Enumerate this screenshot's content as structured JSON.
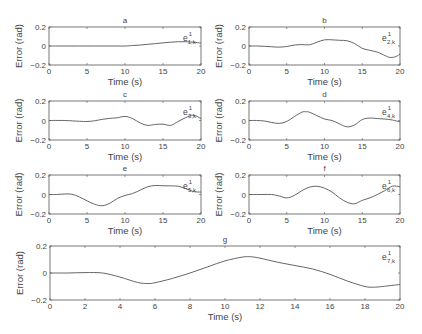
{
  "chart_data": [
    {
      "type": "line",
      "panel": "a",
      "title": "a",
      "xlabel": "Time (s)",
      "ylabel": "Error (rad)",
      "xlim": [
        0,
        20
      ],
      "ylim": [
        -0.2,
        0.2
      ],
      "xticks": [
        0,
        5,
        10,
        15,
        20
      ],
      "yticks": [
        -0.2,
        0,
        0.2
      ],
      "legend": "e^1_{1,k}",
      "x": [
        0,
        2,
        4,
        6,
        8,
        10,
        11,
        12,
        13,
        14,
        15,
        16,
        17,
        18,
        19,
        20
      ],
      "y": [
        0,
        0,
        0,
        0,
        0,
        0,
        0.005,
        0.01,
        0.018,
        0.025,
        0.033,
        0.04,
        0.045,
        0.045,
        0.04,
        0.03
      ]
    },
    {
      "type": "line",
      "panel": "b",
      "title": "b",
      "xlabel": "Time (s)",
      "ylabel": "Error (rad)",
      "xlim": [
        0,
        20
      ],
      "ylim": [
        -0.2,
        0.2
      ],
      "xticks": [
        0,
        5,
        10,
        15,
        20
      ],
      "yticks": [
        -0.2,
        0,
        0.2
      ],
      "legend": "e^1_{2,k}",
      "x": [
        0,
        1,
        2,
        3,
        4,
        5,
        6,
        7,
        8,
        9,
        10,
        11,
        12,
        13,
        14,
        15,
        16,
        17,
        18,
        18.5,
        19,
        19.5,
        20
      ],
      "y": [
        0,
        0,
        -0.003,
        -0.008,
        -0.012,
        -0.005,
        0.01,
        0.015,
        0.012,
        0.04,
        0.065,
        0.065,
        0.06,
        0.055,
        0.025,
        -0.025,
        -0.045,
        -0.065,
        -0.1,
        -0.118,
        -0.12,
        -0.11,
        -0.085
      ]
    },
    {
      "type": "line",
      "panel": "c",
      "title": "c",
      "xlabel": "Time (s)",
      "ylabel": "Error (rad)",
      "xlim": [
        0,
        20
      ],
      "ylim": [
        -0.2,
        0.2
      ],
      "xticks": [
        0,
        5,
        10,
        15,
        20
      ],
      "yticks": [
        -0.2,
        0,
        0.2
      ],
      "legend": "e^1_{3,k}",
      "x": [
        0,
        2,
        4,
        5,
        6,
        7,
        8,
        9,
        10,
        11,
        12,
        13,
        14,
        15,
        16,
        17,
        18,
        19,
        20
      ],
      "y": [
        0,
        0,
        -0.008,
        -0.01,
        -0.003,
        0.012,
        0.022,
        0.028,
        0.042,
        0.02,
        -0.025,
        -0.05,
        -0.04,
        -0.038,
        -0.05,
        -0.01,
        0.03,
        0.055,
        0.02
      ]
    },
    {
      "type": "line",
      "panel": "d",
      "title": "d",
      "xlabel": "Time (s)",
      "ylabel": "Error (rad)",
      "xlim": [
        0,
        20
      ],
      "ylim": [
        -0.2,
        0.2
      ],
      "xticks": [
        0,
        5,
        10,
        15,
        20
      ],
      "yticks": [
        -0.2,
        0,
        0.2
      ],
      "legend": "e^1_{4,k}",
      "x": [
        0,
        1,
        2,
        3,
        4,
        5,
        6,
        7,
        7.5,
        8,
        9,
        10,
        11,
        12,
        13,
        14,
        15,
        16,
        17,
        18,
        19,
        20
      ],
      "y": [
        0,
        0,
        -0.005,
        -0.02,
        -0.03,
        -0.01,
        0.04,
        0.085,
        0.09,
        0.085,
        0.05,
        0.015,
        0,
        -0.035,
        -0.065,
        -0.045,
        0.01,
        0.025,
        0.02,
        0.015,
        0.005,
        -0.015
      ]
    },
    {
      "type": "line",
      "panel": "e",
      "title": "e",
      "xlabel": "Time (s)",
      "ylabel": "Error (rad)",
      "xlim": [
        0,
        20
      ],
      "ylim": [
        -0.2,
        0.2
      ],
      "xticks": [
        0,
        5,
        10,
        15,
        20
      ],
      "yticks": [
        -0.2,
        0,
        0.2
      ],
      "legend": "e^1_{5,k}",
      "x": [
        0,
        1,
        2,
        3,
        4,
        5,
        6,
        7,
        8,
        9,
        10,
        11,
        12,
        13,
        14,
        15,
        16,
        17,
        18,
        19,
        20
      ],
      "y": [
        0,
        0,
        0.005,
        0.003,
        -0.025,
        -0.065,
        -0.1,
        -0.115,
        -0.09,
        -0.04,
        -0.01,
        0.01,
        0.045,
        0.08,
        0.092,
        0.09,
        0.088,
        0.085,
        0.06,
        0.03,
        0.025
      ]
    },
    {
      "type": "line",
      "panel": "f",
      "title": "f",
      "xlabel": "Time (s)",
      "ylabel": "Error (rad)",
      "xlim": [
        0,
        20
      ],
      "ylim": [
        -0.2,
        0.2
      ],
      "xticks": [
        0,
        5,
        10,
        15,
        20
      ],
      "yticks": [
        -0.2,
        0,
        0.2
      ],
      "legend": "e^1_{6,k}",
      "x": [
        0,
        1,
        2,
        3,
        4,
        5,
        6,
        7,
        8,
        9,
        10,
        11,
        12,
        13,
        14,
        15,
        16,
        17,
        18,
        19,
        20
      ],
      "y": [
        0,
        0,
        0,
        0,
        -0.015,
        -0.035,
        -0.01,
        0.04,
        0.075,
        0.085,
        0.065,
        0.025,
        -0.035,
        -0.08,
        -0.095,
        -0.06,
        -0.035,
        0,
        0.04,
        0.085,
        0.08
      ]
    },
    {
      "type": "line",
      "panel": "g",
      "title": "g",
      "xlabel": "Time (s)",
      "ylabel": "Error (rad)",
      "xlim": [
        0,
        20
      ],
      "ylim": [
        -0.2,
        0.2
      ],
      "xticks": [
        0,
        2,
        4,
        6,
        8,
        10,
        12,
        14,
        16,
        18,
        20
      ],
      "yticks": [
        -0.2,
        0,
        0.2
      ],
      "legend": "e^1_{7,k}",
      "x": [
        0,
        1,
        2,
        3,
        4,
        5,
        5.6,
        6,
        7,
        8,
        9,
        10,
        11,
        11.5,
        12,
        13,
        14,
        15,
        16,
        17,
        18,
        18.5,
        19,
        20
      ],
      "y": [
        0,
        0,
        0.003,
        0,
        -0.03,
        -0.07,
        -0.078,
        -0.072,
        -0.04,
        0,
        0.045,
        0.09,
        0.118,
        0.12,
        0.11,
        0.08,
        0.055,
        0.03,
        -0.01,
        -0.06,
        -0.1,
        -0.105,
        -0.1,
        -0.085
      ]
    }
  ],
  "layout": {
    "panels": {
      "a": {
        "x": 49,
        "y": 27,
        "w": 152,
        "h": 38
      },
      "b": {
        "x": 249,
        "y": 27,
        "w": 151,
        "h": 38
      },
      "c": {
        "x": 49,
        "y": 101,
        "w": 152,
        "h": 39
      },
      "d": {
        "x": 249,
        "y": 101,
        "w": 151,
        "h": 39
      },
      "e": {
        "x": 49,
        "y": 175,
        "w": 152,
        "h": 39
      },
      "f": {
        "x": 249,
        "y": 175,
        "w": 151,
        "h": 39
      },
      "g": {
        "x": 50,
        "y": 246,
        "w": 350,
        "h": 54
      }
    },
    "line_color": "#555555",
    "axis_color": "#555555"
  }
}
